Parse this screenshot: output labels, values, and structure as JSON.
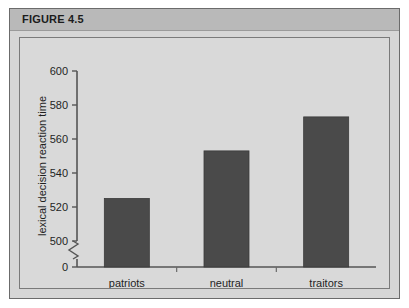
{
  "figure": {
    "title": "FIGURE 4.5"
  },
  "chart_data": {
    "type": "bar",
    "title": "",
    "xlabel": "",
    "ylabel": "lexical decision reaction time",
    "categories": [
      "patriots",
      "neutral",
      "traitors"
    ],
    "values": [
      525,
      553,
      573
    ],
    "ytick_labels": [
      "600",
      "580",
      "560",
      "540",
      "520",
      "500",
      "0"
    ],
    "ytick_values": [
      600,
      580,
      560,
      540,
      520,
      500,
      0
    ],
    "ylim": [
      500,
      600
    ],
    "axis_break": true,
    "axis_break_between": [
      0,
      500
    ],
    "grid": false,
    "legend": null,
    "bar_color": "#4a4a4a",
    "plot_background": "#d9d9d9"
  }
}
